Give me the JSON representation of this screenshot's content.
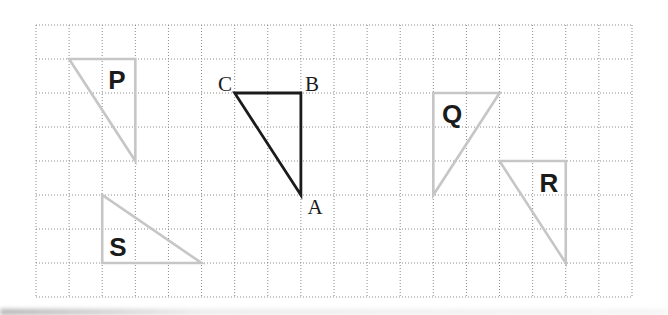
{
  "figure": {
    "background_color": "#ffffff",
    "grid": {
      "x0": 36,
      "y0": 25,
      "cols": 18,
      "rows": 8,
      "cell_width": 33.11,
      "cell_height": 34,
      "line_color": "#8c8c8c",
      "line_style": "dotted",
      "line_width": 1
    },
    "colors": {
      "object_triangle": "#1b1b1b",
      "image_triangles": "#c6c6c6",
      "label_text": "#1b1b1b"
    },
    "triangles": [
      {
        "name": "ABC",
        "role": "object",
        "color": "#1b1b1b",
        "stroke_width": 2.8,
        "vertices_grid": [
          [
            6,
            2
          ],
          [
            8,
            2
          ],
          [
            8,
            5
          ]
        ],
        "vertex_labels": [
          "C",
          "B",
          "A"
        ]
      },
      {
        "name": "P",
        "role": "image",
        "color": "#c6c6c6",
        "stroke_width": 2.6,
        "vertices_grid": [
          [
            1,
            1
          ],
          [
            3,
            1
          ],
          [
            3,
            4
          ]
        ]
      },
      {
        "name": "Q",
        "role": "image",
        "color": "#c6c6c6",
        "stroke_width": 2.6,
        "vertices_grid": [
          [
            12,
            2
          ],
          [
            14,
            2
          ],
          [
            12,
            5
          ]
        ]
      },
      {
        "name": "R",
        "role": "image",
        "color": "#c6c6c6",
        "stroke_width": 2.6,
        "vertices_grid": [
          [
            14,
            4
          ],
          [
            16,
            4
          ],
          [
            16,
            7
          ]
        ]
      },
      {
        "name": "S",
        "role": "image",
        "color": "#c6c6c6",
        "stroke_width": 2.6,
        "vertices_grid": [
          [
            2,
            5
          ],
          [
            2,
            7
          ],
          [
            5,
            7
          ]
        ]
      }
    ],
    "labels": [
      {
        "text": "P",
        "x": 117,
        "y": 80,
        "style": "bold-sans",
        "size": 26
      },
      {
        "text": "Q",
        "x": 452,
        "y": 114,
        "style": "bold-sans",
        "size": 26
      },
      {
        "text": "R",
        "x": 549,
        "y": 183,
        "style": "bold-sans",
        "size": 26
      },
      {
        "text": "S",
        "x": 118,
        "y": 247,
        "style": "bold-sans",
        "size": 26
      },
      {
        "text": "C",
        "x": 225,
        "y": 84,
        "style": "serif",
        "size": 21
      },
      {
        "text": "B",
        "x": 312,
        "y": 84,
        "style": "serif",
        "size": 21
      },
      {
        "text": "A",
        "x": 315,
        "y": 207,
        "style": "serif",
        "size": 21
      }
    ],
    "canvas": {
      "width": 668,
      "height": 315
    }
  }
}
